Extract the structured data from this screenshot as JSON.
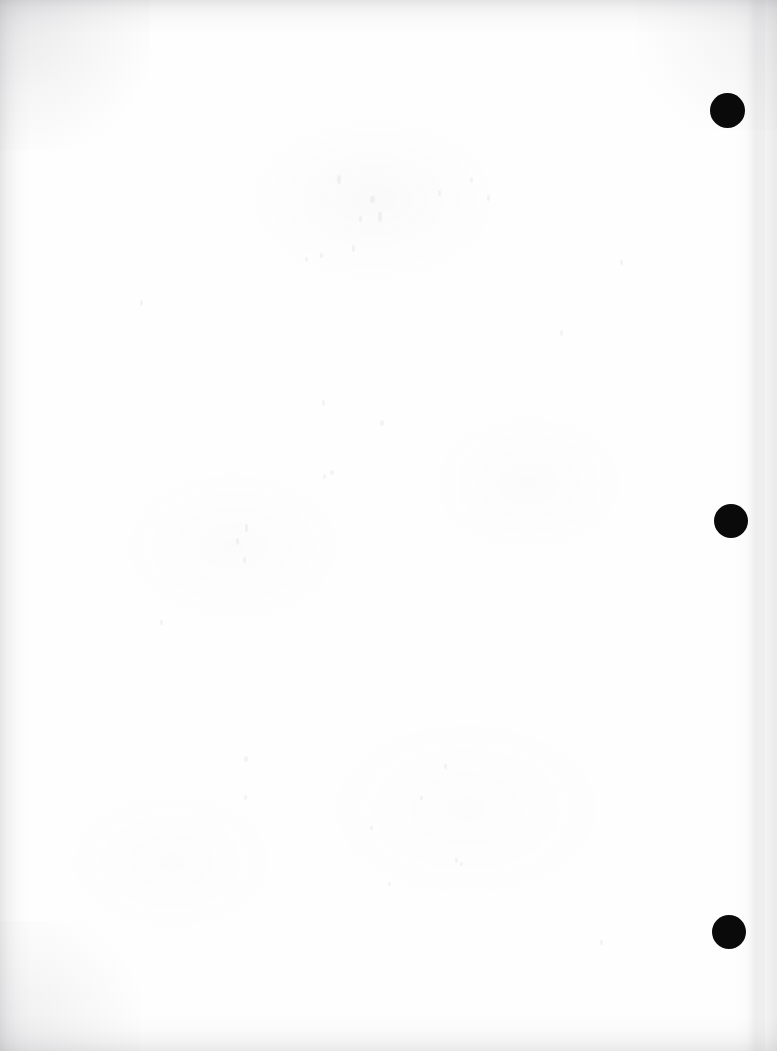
{
  "document": {
    "kind": "scanned-page",
    "page_state": "blank",
    "page_width": 777,
    "page_height": 1051,
    "background_color": "#fefefe",
    "body_text": "",
    "caption": ""
  },
  "colors": {
    "paper": "#fefefe",
    "mark": "#0a0a0a",
    "scan_edge_shadow": "#96969b"
  },
  "margin_marks": {
    "name": "right-margin-marks",
    "count": 3,
    "color": "#0a0a0a",
    "shape": "circle",
    "items": [
      {
        "label": "mark-1",
        "cx": 727,
        "cy": 110,
        "d": 35
      },
      {
        "label": "mark-2",
        "cx": 731,
        "cy": 521,
        "d": 34
      },
      {
        "label": "mark-3",
        "cx": 729,
        "cy": 932,
        "d": 34
      }
    ]
  },
  "scan_edges": {
    "top_label": "top-scan-edge",
    "left_label": "left-scan-edge",
    "right_label": "right-scan-edge",
    "bottom_label": "bottom-scan-edge"
  },
  "specks": [
    {
      "x": 337,
      "y": 175,
      "w": 4,
      "h": 9
    },
    {
      "x": 370,
      "y": 196,
      "w": 5,
      "h": 7
    },
    {
      "x": 378,
      "y": 212,
      "w": 4,
      "h": 10
    },
    {
      "x": 359,
      "y": 216,
      "w": 3,
      "h": 6
    },
    {
      "x": 438,
      "y": 190,
      "w": 3,
      "h": 6
    },
    {
      "x": 470,
      "y": 177,
      "w": 3,
      "h": 5
    },
    {
      "x": 487,
      "y": 195,
      "w": 3,
      "h": 6
    },
    {
      "x": 352,
      "y": 245,
      "w": 3,
      "h": 7
    },
    {
      "x": 305,
      "y": 257,
      "w": 3,
      "h": 5
    },
    {
      "x": 320,
      "y": 253,
      "w": 3,
      "h": 5
    },
    {
      "x": 322,
      "y": 400,
      "w": 3,
      "h": 6
    },
    {
      "x": 380,
      "y": 420,
      "w": 4,
      "h": 6
    },
    {
      "x": 330,
      "y": 470,
      "w": 4,
      "h": 5
    },
    {
      "x": 323,
      "y": 474,
      "w": 3,
      "h": 5
    },
    {
      "x": 245,
      "y": 524,
      "w": 3,
      "h": 8
    },
    {
      "x": 236,
      "y": 538,
      "w": 3,
      "h": 7
    },
    {
      "x": 243,
      "y": 557,
      "w": 3,
      "h": 6
    },
    {
      "x": 244,
      "y": 756,
      "w": 4,
      "h": 6
    },
    {
      "x": 444,
      "y": 764,
      "w": 3,
      "h": 5
    },
    {
      "x": 244,
      "y": 795,
      "w": 3,
      "h": 5
    },
    {
      "x": 420,
      "y": 796,
      "w": 3,
      "h": 4
    },
    {
      "x": 370,
      "y": 826,
      "w": 3,
      "h": 4
    },
    {
      "x": 455,
      "y": 858,
      "w": 3,
      "h": 5
    },
    {
      "x": 460,
      "y": 862,
      "w": 3,
      "h": 4
    },
    {
      "x": 388,
      "y": 882,
      "w": 3,
      "h": 4
    },
    {
      "x": 600,
      "y": 940,
      "w": 3,
      "h": 5
    },
    {
      "x": 140,
      "y": 300,
      "w": 3,
      "h": 6
    },
    {
      "x": 160,
      "y": 620,
      "w": 3,
      "h": 5
    },
    {
      "x": 560,
      "y": 330,
      "w": 3,
      "h": 6
    },
    {
      "x": 620,
      "y": 260,
      "w": 3,
      "h": 5
    }
  ]
}
